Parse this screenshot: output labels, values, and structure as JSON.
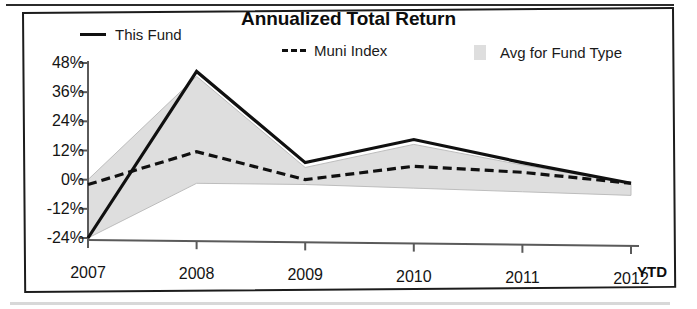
{
  "chart_title": "Annualized Total Return",
  "legend": {
    "items": [
      {
        "label": "This Fund",
        "marker": "solid-line-swatch",
        "color": "#101010"
      },
      {
        "label": "Muni Index",
        "marker": "dashed-line-swatch",
        "color": "#101010"
      },
      {
        "label": "Avg for Fund Type",
        "marker": "filled-area-swatch",
        "color": "#dedede"
      }
    ]
  },
  "axes": {
    "x_suffix_label": "YTD",
    "y_tick_labels": [
      "48%",
      "36%",
      "24%",
      "12%",
      "0%",
      "-12%",
      "-24%"
    ],
    "x_tick_labels": [
      "2007",
      "2008",
      "2009",
      "2010",
      "2011",
      "2012"
    ]
  },
  "chart_data": {
    "type": "line",
    "title": "Annualized Total Return",
    "xlabel": "",
    "ylabel": "",
    "categories": [
      "2007",
      "2008",
      "2009",
      "2010",
      "2011",
      "2012"
    ],
    "x_axis_note": "2012 is YTD",
    "ylim": [
      -24,
      48
    ],
    "yticks": [
      48,
      36,
      24,
      12,
      0,
      -12,
      -24
    ],
    "ytick_format": "percent",
    "grid": false,
    "legend_position": "top",
    "series": [
      {
        "name": "This Fund",
        "style": "solid",
        "color": "#101010",
        "values": [
          -24,
          45,
          8,
          18,
          9,
          1
        ]
      },
      {
        "name": "Muni Index",
        "style": "dashed",
        "color": "#101010",
        "values": [
          -2,
          12,
          1,
          7,
          5,
          1
        ]
      },
      {
        "name": "Avg for Fund Type",
        "style": "filled-band",
        "color": "#dedede",
        "band_upper": [
          0,
          43,
          6,
          16,
          8,
          1
        ],
        "band_lower": [
          -24,
          -1,
          -1,
          -2,
          -3,
          -4
        ]
      }
    ]
  }
}
